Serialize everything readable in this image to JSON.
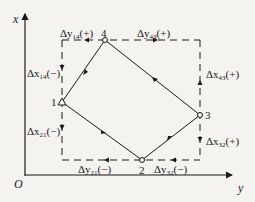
{
  "axes": {
    "vertical_label": "x",
    "horizontal_label": "y",
    "origin_label": "O"
  },
  "points": [
    {
      "id": "1",
      "label": "1"
    },
    {
      "id": "2",
      "label": "2"
    },
    {
      "id": "3",
      "label": "3"
    },
    {
      "id": "4",
      "label": "4"
    }
  ],
  "increments": {
    "dy14": {
      "sym": "Δy",
      "sub": "14",
      "sign": "(+)"
    },
    "dy43": {
      "sym": "Δy",
      "sub": "43",
      "sign": "(+)"
    },
    "dx14": {
      "sym": "Δx",
      "sub": "14",
      "sign": "(−)"
    },
    "dx43": {
      "sym": "Δx",
      "sub": "43",
      "sign": "(+)"
    },
    "dx21": {
      "sym": "Δx",
      "sub": "21",
      "sign": "(−)"
    },
    "dx32": {
      "sym": "Δx",
      "sub": "32",
      "sign": "(+)"
    },
    "dy21": {
      "sym": "Δy",
      "sub": "21",
      "sign": "(−)"
    },
    "dy32": {
      "sym": "Δy",
      "sub": "32",
      "sign": "(−)"
    }
  },
  "colors": {
    "line": "#1a1a1a",
    "background": "#f4f3f0"
  }
}
